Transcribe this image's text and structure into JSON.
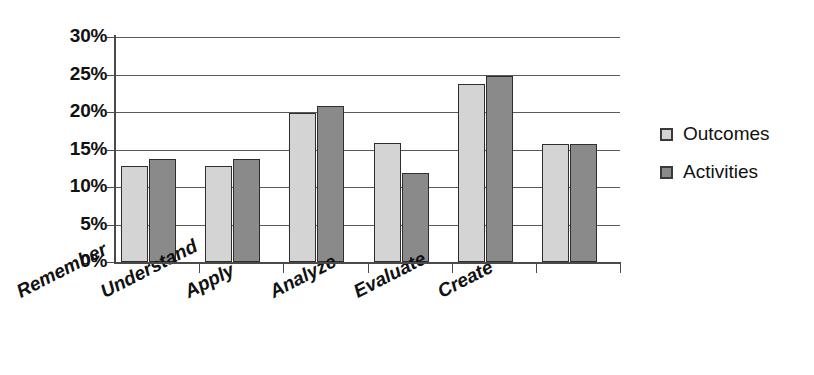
{
  "chart_data": {
    "type": "bar",
    "title": "",
    "xlabel": "",
    "ylabel": "",
    "categories": [
      "Remember",
      "Understand",
      "Apply",
      "Analyze",
      "Evaluate",
      "Create"
    ],
    "series": [
      {
        "name": "Outcomes",
        "color": "#d4d4d4",
        "values": [
          12.8,
          12.8,
          19.9,
          15.9,
          23.7,
          15.8
        ]
      },
      {
        "name": "Activities",
        "color": "#8a8a8a",
        "values": [
          13.8,
          13.8,
          20.8,
          11.9,
          24.8,
          15.8
        ]
      }
    ],
    "ylim": [
      0,
      30
    ],
    "yticks": [
      0,
      5,
      10,
      15,
      20,
      25,
      30
    ],
    "ytick_labels": [
      "0%",
      "5%",
      "10%",
      "15%",
      "20%",
      "25%",
      "30%"
    ],
    "grid": true,
    "legend_position": "right"
  }
}
